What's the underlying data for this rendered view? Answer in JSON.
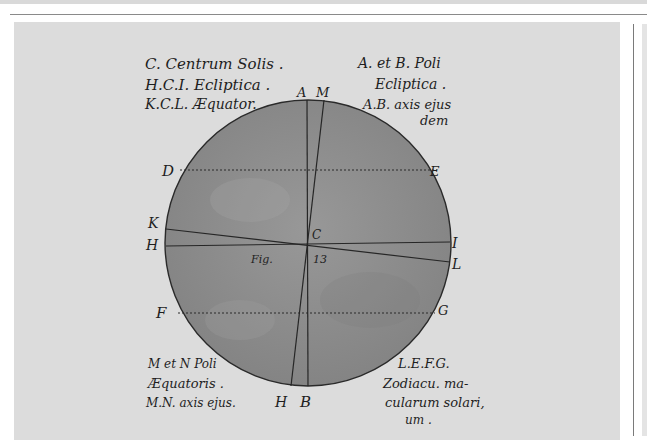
{
  "figure": {
    "legend_top_left": [
      "C. Centrum Solis .",
      "H.C.I. Ecliptica .",
      "K.C.L. Æquator."
    ],
    "legend_top_right": [
      "A. et B. Poli",
      "Ecliptica .",
      "A.B. axis ejus",
      "dem"
    ],
    "legend_bottom_left": [
      "M et N Poli",
      "Æquatoris .",
      "M.N. axis ejus."
    ],
    "legend_bottom_right": [
      "L.E.F.G.",
      "Zodiacu. ma-",
      "cularum solari,",
      "um ."
    ],
    "points": {
      "A": "A",
      "M": "M",
      "B": "B",
      "H_bottom": "H",
      "D": "D",
      "E": "E",
      "K": "K",
      "H": "H",
      "I": "I",
      "L": "L",
      "F": "F",
      "G": "G",
      "C": "C"
    },
    "caption": {
      "fig": "Fig.",
      "num": "13"
    }
  },
  "colors": {
    "page": "#ffffff",
    "card": "#dcdcdc",
    "disc": "#8f8f8f",
    "ink": "#1e1e1e"
  }
}
